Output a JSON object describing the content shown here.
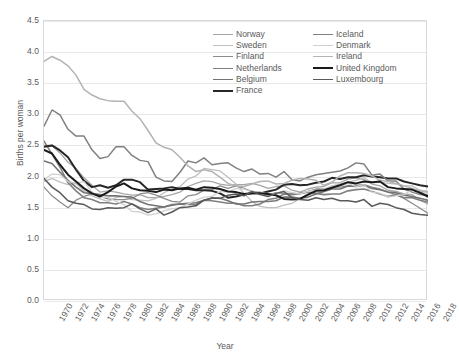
{
  "chart_data": {
    "type": "line",
    "title": "",
    "xlabel": "Year",
    "ylabel": "Births per woman",
    "grid": "horizontal",
    "legend_position": "top-right-inside",
    "legend_columns": 2,
    "xlim": [
      1970,
      2018
    ],
    "ylim": [
      0.0,
      4.5
    ],
    "y_ticks": [
      "0.0",
      "0.5",
      "1.0",
      "1.5",
      "2.0",
      "2.5",
      "3.0",
      "3.5",
      "4.0",
      "4.5"
    ],
    "y_tick_values": [
      0.0,
      0.5,
      1.0,
      1.5,
      2.0,
      2.5,
      3.0,
      3.5,
      4.0,
      4.5
    ],
    "x_ticks": [
      "1970",
      "1972",
      "1974",
      "1976",
      "1978",
      "1980",
      "1982",
      "1984",
      "1986",
      "1988",
      "1990",
      "1992",
      "1994",
      "1996",
      "1998",
      "2000",
      "2002",
      "2004",
      "2006",
      "2008",
      "2010",
      "2012",
      "2014",
      "2016",
      "2018"
    ],
    "x": [
      1970,
      1971,
      1972,
      1973,
      1974,
      1975,
      1976,
      1977,
      1978,
      1979,
      1980,
      1981,
      1982,
      1983,
      1984,
      1985,
      1986,
      1987,
      1988,
      1989,
      1990,
      1991,
      1992,
      1993,
      1994,
      1995,
      1996,
      1997,
      1998,
      1999,
      2000,
      2001,
      2002,
      2003,
      2004,
      2005,
      2006,
      2007,
      2008,
      2009,
      2010,
      2011,
      2012,
      2013,
      2014,
      2015,
      2016,
      2017,
      2018
    ],
    "series": [
      {
        "name": "Norway",
        "color": "#a6a6a6",
        "width": 1.3,
        "values": [
          2.5,
          2.5,
          2.38,
          2.23,
          2.13,
          1.98,
          1.86,
          1.75,
          1.77,
          1.75,
          1.72,
          1.7,
          1.71,
          1.66,
          1.66,
          1.68,
          1.71,
          1.75,
          1.84,
          1.89,
          1.93,
          1.92,
          1.88,
          1.86,
          1.87,
          1.87,
          1.89,
          1.86,
          1.81,
          1.84,
          1.85,
          1.78,
          1.75,
          1.8,
          1.83,
          1.84,
          1.9,
          1.9,
          1.96,
          1.98,
          1.95,
          1.88,
          1.85,
          1.78,
          1.76,
          1.72,
          1.71,
          1.62,
          1.56
        ]
      },
      {
        "name": "Sweden",
        "color": "#bfbfbf",
        "width": 1.3,
        "values": [
          1.92,
          1.97,
          1.91,
          1.87,
          1.89,
          1.77,
          1.69,
          1.64,
          1.6,
          1.66,
          1.68,
          1.63,
          1.62,
          1.61,
          1.65,
          1.74,
          1.8,
          1.84,
          1.96,
          2.01,
          2.13,
          2.11,
          2.09,
          1.99,
          1.88,
          1.73,
          1.6,
          1.52,
          1.5,
          1.5,
          1.54,
          1.57,
          1.65,
          1.71,
          1.75,
          1.77,
          1.85,
          1.88,
          1.91,
          1.94,
          1.98,
          1.9,
          1.91,
          1.89,
          1.88,
          1.85,
          1.85,
          1.78,
          1.76
        ]
      },
      {
        "name": "Finland",
        "color": "#8c8c8c",
        "width": 1.3,
        "values": [
          1.83,
          1.69,
          1.59,
          1.5,
          1.62,
          1.68,
          1.72,
          1.68,
          1.64,
          1.63,
          1.63,
          1.65,
          1.72,
          1.74,
          1.7,
          1.65,
          1.6,
          1.59,
          1.69,
          1.71,
          1.78,
          1.79,
          1.85,
          1.81,
          1.85,
          1.81,
          1.76,
          1.75,
          1.7,
          1.74,
          1.73,
          1.73,
          1.72,
          1.76,
          1.8,
          1.8,
          1.84,
          1.83,
          1.85,
          1.86,
          1.87,
          1.83,
          1.8,
          1.75,
          1.71,
          1.65,
          1.57,
          1.49,
          1.41
        ]
      },
      {
        "name": "Netherlands",
        "color": "#808080",
        "width": 1.6,
        "values": [
          2.57,
          2.36,
          2.15,
          1.9,
          1.77,
          1.66,
          1.63,
          1.58,
          1.58,
          1.56,
          1.6,
          1.56,
          1.5,
          1.47,
          1.49,
          1.51,
          1.55,
          1.56,
          1.55,
          1.55,
          1.62,
          1.61,
          1.59,
          1.57,
          1.57,
          1.53,
          1.53,
          1.56,
          1.63,
          1.65,
          1.72,
          1.71,
          1.73,
          1.75,
          1.73,
          1.71,
          1.72,
          1.72,
          1.77,
          1.79,
          1.8,
          1.76,
          1.72,
          1.68,
          1.71,
          1.66,
          1.66,
          1.62,
          1.59
        ]
      },
      {
        "name": "Belgium",
        "color": "#737373",
        "width": 1.6,
        "values": [
          2.25,
          2.21,
          2.07,
          1.94,
          1.83,
          1.74,
          1.73,
          1.71,
          1.69,
          1.69,
          1.68,
          1.67,
          1.6,
          1.55,
          1.53,
          1.51,
          1.54,
          1.56,
          1.57,
          1.58,
          1.62,
          1.66,
          1.65,
          1.61,
          1.56,
          1.56,
          1.59,
          1.6,
          1.6,
          1.61,
          1.67,
          1.67,
          1.65,
          1.67,
          1.72,
          1.76,
          1.8,
          1.8,
          1.85,
          1.84,
          1.86,
          1.81,
          1.79,
          1.75,
          1.74,
          1.7,
          1.68,
          1.65,
          1.62
        ]
      },
      {
        "name": "France",
        "color": "#262626",
        "width": 2.0,
        "values": [
          2.48,
          2.5,
          2.42,
          2.31,
          2.11,
          1.93,
          1.83,
          1.86,
          1.82,
          1.86,
          1.95,
          1.95,
          1.91,
          1.79,
          1.8,
          1.81,
          1.83,
          1.8,
          1.8,
          1.78,
          1.78,
          1.77,
          1.73,
          1.66,
          1.68,
          1.71,
          1.73,
          1.73,
          1.76,
          1.79,
          1.87,
          1.88,
          1.86,
          1.87,
          1.9,
          1.92,
          1.98,
          1.96,
          1.99,
          1.99,
          2.02,
          2.0,
          1.99,
          1.97,
          1.97,
          1.92,
          1.89,
          1.86,
          1.84
        ]
      },
      {
        "name": "Iceland",
        "color": "#808080",
        "width": 1.5,
        "values": [
          2.81,
          3.07,
          2.99,
          2.76,
          2.65,
          2.65,
          2.43,
          2.29,
          2.32,
          2.48,
          2.48,
          2.34,
          2.26,
          2.24,
          1.99,
          1.93,
          1.92,
          2.07,
          2.25,
          2.22,
          2.3,
          2.19,
          2.21,
          2.22,
          2.14,
          2.08,
          2.12,
          2.04,
          2.05,
          1.99,
          2.08,
          1.95,
          1.93,
          1.99,
          2.03,
          2.05,
          2.07,
          2.09,
          2.14,
          2.22,
          2.2,
          2.02,
          2.04,
          1.93,
          1.93,
          1.8,
          1.75,
          1.71,
          1.7
        ]
      },
      {
        "name": "Denmark",
        "color": "#d0d0d0",
        "width": 1.3,
        "values": [
          1.95,
          2.04,
          2.03,
          1.92,
          1.9,
          1.92,
          1.75,
          1.66,
          1.67,
          1.6,
          1.55,
          1.44,
          1.43,
          1.38,
          1.4,
          1.45,
          1.48,
          1.5,
          1.56,
          1.62,
          1.67,
          1.68,
          1.76,
          1.75,
          1.81,
          1.8,
          1.75,
          1.75,
          1.72,
          1.73,
          1.77,
          1.74,
          1.72,
          1.76,
          1.78,
          1.8,
          1.85,
          1.84,
          1.89,
          1.84,
          1.87,
          1.75,
          1.73,
          1.67,
          1.69,
          1.71,
          1.79,
          1.75,
          1.73
        ]
      },
      {
        "name": "Ireland",
        "color": "#b3b3b3",
        "width": 1.5,
        "values": [
          3.85,
          3.93,
          3.87,
          3.78,
          3.63,
          3.4,
          3.31,
          3.25,
          3.22,
          3.21,
          3.21,
          3.05,
          2.93,
          2.74,
          2.54,
          2.47,
          2.43,
          2.31,
          2.17,
          2.08,
          2.11,
          2.08,
          1.99,
          1.89,
          1.85,
          1.84,
          1.88,
          1.92,
          1.93,
          1.88,
          1.89,
          1.94,
          1.97,
          1.96,
          1.94,
          1.86,
          1.91,
          2.01,
          2.06,
          2.06,
          2.05,
          2.01,
          1.94,
          1.92,
          1.89,
          1.85,
          1.81,
          1.77,
          1.75
        ]
      },
      {
        "name": "United Kingdom",
        "color": "#1a1a1a",
        "width": 2.0,
        "values": [
          2.43,
          2.37,
          2.19,
          2.03,
          1.92,
          1.81,
          1.73,
          1.68,
          1.75,
          1.84,
          1.89,
          1.81,
          1.78,
          1.77,
          1.75,
          1.79,
          1.78,
          1.81,
          1.82,
          1.79,
          1.83,
          1.82,
          1.8,
          1.76,
          1.75,
          1.72,
          1.73,
          1.73,
          1.72,
          1.7,
          1.64,
          1.63,
          1.64,
          1.71,
          1.77,
          1.78,
          1.82,
          1.86,
          1.91,
          1.89,
          1.92,
          1.91,
          1.92,
          1.83,
          1.81,
          1.8,
          1.79,
          1.74,
          1.68
        ]
      },
      {
        "name": "Luxembourg",
        "color": "#595959",
        "width": 1.5,
        "values": [
          1.97,
          1.83,
          1.74,
          1.61,
          1.57,
          1.55,
          1.48,
          1.47,
          1.5,
          1.49,
          1.5,
          1.56,
          1.48,
          1.42,
          1.48,
          1.38,
          1.43,
          1.5,
          1.51,
          1.53,
          1.62,
          1.65,
          1.65,
          1.7,
          1.72,
          1.69,
          1.76,
          1.71,
          1.68,
          1.73,
          1.76,
          1.66,
          1.63,
          1.62,
          1.66,
          1.63,
          1.65,
          1.61,
          1.61,
          1.59,
          1.63,
          1.52,
          1.57,
          1.55,
          1.5,
          1.47,
          1.41,
          1.39,
          1.38
        ]
      }
    ]
  },
  "axes": {
    "y_title": "Births per woman",
    "x_title": "Year"
  },
  "legend": {
    "column_left": [
      {
        "label": "Norway",
        "color": "#a6a6a6",
        "width": "1.3px"
      },
      {
        "label": "Sweden",
        "color": "#bfbfbf",
        "width": "1.3px"
      },
      {
        "label": "Finland",
        "color": "#8c8c8c",
        "width": "1.3px"
      },
      {
        "label": "Netherlands",
        "color": "#808080",
        "width": "1.6px"
      },
      {
        "label": "Belgium",
        "color": "#737373",
        "width": "1.6px"
      },
      {
        "label": "France",
        "color": "#262626",
        "width": "2.0px"
      }
    ],
    "column_right": [
      {
        "label": "Iceland",
        "color": "#808080",
        "width": "1.5px"
      },
      {
        "label": "Denmark",
        "color": "#d0d0d0",
        "width": "1.3px"
      },
      {
        "label": "Ireland",
        "color": "#b3b3b3",
        "width": "1.5px"
      },
      {
        "label": "United Kingdom",
        "color": "#1a1a1a",
        "width": "2.0px"
      },
      {
        "label": "Luxembourg",
        "color": "#595959",
        "width": "1.5px"
      }
    ]
  }
}
